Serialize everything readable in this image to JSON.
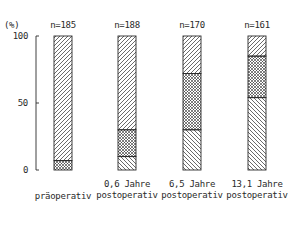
{
  "chart_data": {
    "type": "bar",
    "stacked": true,
    "title": "",
    "xlabel": "",
    "ylabel": "(%)",
    "ylim": [
      0,
      100
    ],
    "yticks": [
      0,
      50,
      100
    ],
    "grid": false,
    "legend": null,
    "categories": [
      "präoperativ",
      "0,6 Jahre postoperativ",
      "6,5 Jahre postoperativ",
      "13,1 Jahre postoperativ"
    ],
    "n_labels": [
      "n=185",
      "n=188",
      "n=170",
      "n=161"
    ],
    "series": [
      {
        "name": "backward-diagonal hatch (bottom)",
        "pattern": "hatch-down",
        "values": [
          0,
          10,
          30,
          54
        ]
      },
      {
        "name": "cross-hatch (middle)",
        "pattern": "crosshatch",
        "values": [
          7,
          20,
          42,
          31
        ]
      },
      {
        "name": "forward-diagonal hatch (top)",
        "pattern": "hatch-up",
        "values": [
          93,
          70,
          28,
          15
        ]
      }
    ]
  },
  "axis": {
    "unit_label": "(%)",
    "ticks": [
      {
        "label": "100",
        "value": 100
      },
      {
        "label": "50",
        "value": 50
      },
      {
        "label": "0",
        "value": 0
      }
    ]
  },
  "bars": [
    {
      "n": "n=185",
      "label_line1": "",
      "label_line2": "präoperativ"
    },
    {
      "n": "n=188",
      "label_line1": "0,6 Jahre",
      "label_line2": "postoperativ"
    },
    {
      "n": "n=170",
      "label_line1": "6,5 Jahre",
      "label_line2": "postoperativ"
    },
    {
      "n": "n=161",
      "label_line1": "13,1 Jahre",
      "label_line2": "postoperativ"
    }
  ],
  "colors": {
    "ink": "#2a2a2a",
    "background": "#ffffff"
  }
}
